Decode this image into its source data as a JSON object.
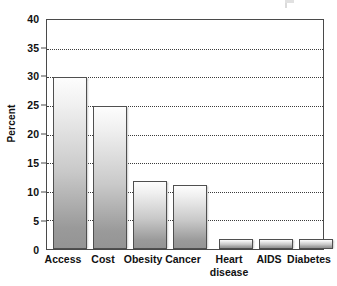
{
  "chart_data": {
    "type": "bar",
    "title": "",
    "subtitle": "",
    "xlabel": "",
    "ylabel": "Percent",
    "categories": [
      "Access",
      "Cost",
      "Obesity",
      "Cancer",
      "Heart disease",
      "AIDS",
      "Diabetes"
    ],
    "category_lines": [
      [
        "Access"
      ],
      [
        "Cost"
      ],
      [
        "Obesity"
      ],
      [
        "Cancer"
      ],
      [
        "Heart",
        "disease"
      ],
      [
        "AIDS"
      ],
      [
        "Diabetes"
      ]
    ],
    "values": [
      30,
      25,
      11.8,
      11.2,
      1.8,
      1.7,
      1.7
    ],
    "value_unit": "%",
    "ylim": [
      0,
      40
    ],
    "y_ticks": [
      "0",
      "5",
      "10",
      "15",
      "20",
      "25",
      "30",
      "35",
      "40"
    ],
    "y_tick_values": [
      0,
      5,
      10,
      15,
      20,
      25,
      30,
      35,
      40
    ],
    "y_tick_step": 5,
    "grid": "horizontal-dotted",
    "legend": "none",
    "legend_position": "none",
    "bar_fill_top": "#fdfdfd",
    "bar_fill_bottom": "#949494",
    "bar_border_color": "#4f4f4f",
    "gridline_color": "#3b3b3b",
    "axis_color": "#4a4a4a",
    "background_color": "#ffffff",
    "text_color": "#111111"
  }
}
